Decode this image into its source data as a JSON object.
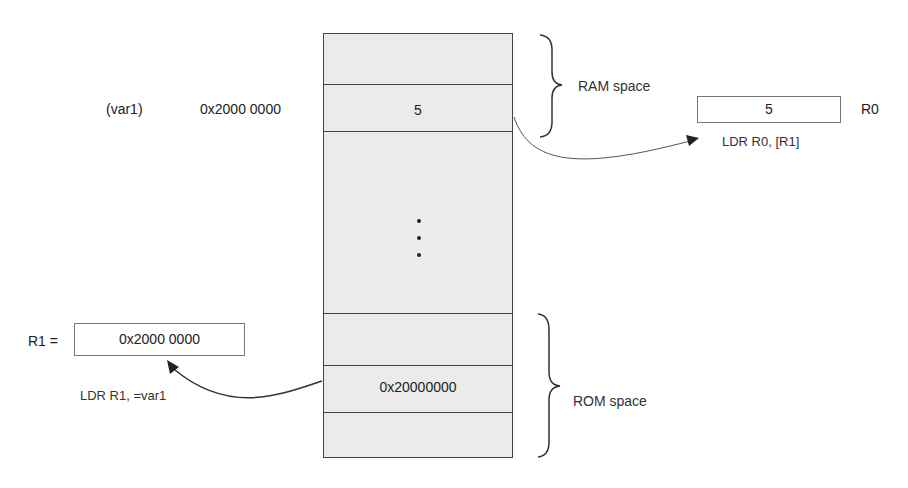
{
  "memory": {
    "ram_label": "RAM space",
    "rom_label": "ROM space",
    "var_name": "(var1)",
    "var_address": "0x2000 0000",
    "ram_cell_value": "5",
    "rom_cell_value": "0x20000000",
    "ellipsis": "⋮"
  },
  "registers": {
    "r0": {
      "name": "R0",
      "value": "5",
      "instruction": "LDR R0, [R1]"
    },
    "r1": {
      "name": "R1 =",
      "value": "0x2000 0000",
      "instruction": "LDR R1, =var1"
    }
  }
}
